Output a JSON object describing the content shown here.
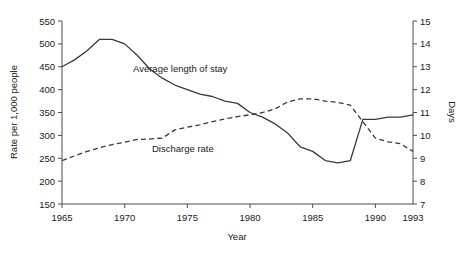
{
  "chart_data": {
    "type": "line",
    "title": "",
    "xlabel": "Year",
    "ylabel": "Rate per 1,000 people",
    "y2label": "Days",
    "xlim": [
      1965,
      1993
    ],
    "ylim": [
      150,
      550
    ],
    "y2lim": [
      7,
      15
    ],
    "grid": false,
    "legend_position": "inline-annotations",
    "x_ticks": [
      "1965",
      "1970",
      "1975",
      "1980",
      "1985",
      "1990",
      "1993"
    ],
    "x_tick_values": [
      1965,
      1970,
      1975,
      1980,
      1985,
      1990,
      1993
    ],
    "y_ticks": [
      "150",
      "200",
      "250",
      "300",
      "350",
      "400",
      "450",
      "500",
      "550"
    ],
    "y_tick_values": [
      150,
      200,
      250,
      300,
      350,
      400,
      450,
      500,
      550
    ],
    "y2_ticks": [
      "7",
      "8",
      "9",
      "10",
      "11",
      "12",
      "13",
      "14",
      "15"
    ],
    "y2_tick_values": [
      7,
      8,
      9,
      10,
      11,
      12,
      13,
      14,
      15
    ],
    "x": [
      1965,
      1966,
      1967,
      1968,
      1969,
      1970,
      1971,
      1972,
      1973,
      1974,
      1975,
      1976,
      1977,
      1978,
      1979,
      1980,
      1981,
      1982,
      1983,
      1984,
      1985,
      1986,
      1987,
      1988,
      1989,
      1990,
      1991,
      1992,
      1993
    ],
    "series": [
      {
        "name": "Average length of stay",
        "axis": "right",
        "units": "Days",
        "style": "solid",
        "label_text": "Average length of stay",
        "values": [
          13.0,
          13.3,
          13.7,
          14.2,
          14.2,
          14.0,
          13.5,
          12.9,
          12.5,
          12.2,
          12.0,
          11.8,
          11.7,
          11.5,
          11.4,
          11.0,
          10.8,
          10.5,
          10.1,
          9.5,
          9.3,
          8.9,
          8.8,
          8.9,
          10.7,
          10.7,
          10.8,
          10.8,
          10.9
        ]
      },
      {
        "name": "Discharge rate",
        "axis": "left",
        "units": "Rate per 1,000 people",
        "style": "dashed",
        "label_text": "Discharge rate",
        "values": [
          245,
          255,
          265,
          273,
          280,
          285,
          291,
          292,
          294,
          312,
          318,
          323,
          330,
          336,
          341,
          345,
          350,
          358,
          373,
          380,
          380,
          375,
          372,
          366,
          330,
          294,
          286,
          282,
          265
        ]
      }
    ],
    "annotations": [
      {
        "text": "Average length of stay",
        "x_px": 133,
        "y_px": 72
      },
      {
        "text": "Discharge rate",
        "x_px": 152,
        "y_px": 152
      }
    ]
  },
  "colors": {
    "background": "#ffffff",
    "axis": "#4d4d4d",
    "line": "#3a3a3a",
    "text": "#1a1a1a"
  }
}
